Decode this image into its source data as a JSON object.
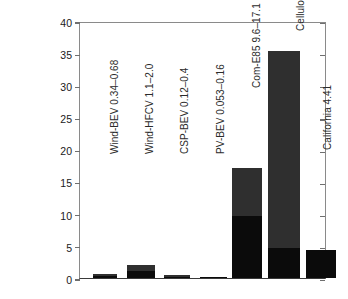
{
  "chart_data": {
    "type": "bar",
    "title": "",
    "xlabel": "",
    "ylabel": "Percent of U.S. land for technology spacing to power U.S. vehicles",
    "ylabel_lines": [
      "Percent of U.S. land for technology",
      "spacing to power U.S. vehicles"
    ],
    "ylim": [
      0,
      40
    ],
    "yticks": [
      0,
      5,
      10,
      15,
      20,
      25,
      30,
      35,
      40
    ],
    "ytick_labels": [
      "0",
      "5",
      "10",
      "15",
      "20",
      "25",
      "30",
      "35",
      "40"
    ],
    "grid": false,
    "legend": "none",
    "stacked": true,
    "series": [
      {
        "name": "low value",
        "color": "#0b0b0b",
        "values": [
          0.34,
          1.1,
          0.12,
          0.053,
          9.6,
          4.6,
          4.41
        ]
      },
      {
        "name": "high value",
        "color": "#2f2f2f",
        "values": [
          0.68,
          2.0,
          0.4,
          0.16,
          17.1,
          35.3,
          4.41
        ]
      }
    ],
    "categories": [
      "Wind-BEV 0.34–0.68",
      "Wind-HFCV 1.1–2.0",
      "CSP-BEV 0.12–0.4",
      "PV-BEV 0.053–0.16",
      "Com-E85 9.6–17.1",
      "Cellulosic-E85 4.6–34.3",
      "California 4.41"
    ],
    "bars": [
      {
        "label": "Wind-BEV 0.34–0.68",
        "low": 0.34,
        "high": 0.68,
        "x": 13,
        "width": 24
      },
      {
        "label": "Wind-HFCV 1.1–2.0",
        "low": 1.1,
        "high": 2.0,
        "x": 47,
        "width": 28
      },
      {
        "label": "CSP-BEV 0.12–0.4",
        "low": 0.12,
        "high": 0.4,
        "x": 84,
        "width": 26
      },
      {
        "label": "PV-BEV 0.053–0.16",
        "low": 0.053,
        "high": 0.16,
        "x": 120,
        "width": 27
      },
      {
        "label": "Com-E85 9.6–17.1",
        "low": 9.6,
        "high": 17.1,
        "x": 152,
        "width": 30
      },
      {
        "label": "Cellulosic-E85 4.6–34.3",
        "low": 4.6,
        "high": 35.3,
        "x": 188,
        "width": 32
      },
      {
        "label": "California 4.41",
        "low": 4.41,
        "high": 4.41,
        "x": 226,
        "width": 30
      }
    ],
    "label_positions": [
      {
        "left": 30,
        "bottom": 126
      },
      {
        "left": 65,
        "bottom": 126
      },
      {
        "left": 100,
        "bottom": 126
      },
      {
        "left": 136,
        "bottom": 126
      },
      {
        "left": 172,
        "bottom": 192
      },
      {
        "left": 216,
        "bottom": 249
      },
      {
        "left": 243,
        "bottom": 130
      }
    ],
    "colors": {
      "low_segment": "#0b0b0b",
      "high_segment": "#2f2f2f",
      "axis": "#6f6f6f",
      "text": "#1a1a1a",
      "background": "#ffffff"
    }
  }
}
